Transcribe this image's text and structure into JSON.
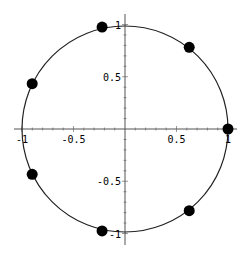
{
  "chart_data": {
    "type": "scatter",
    "title": "",
    "xlabel": "",
    "ylabel": "",
    "xlim": [
      -1.1,
      1.1
    ],
    "ylim": [
      -1.1,
      1.1
    ],
    "grid": false,
    "legend": null,
    "curve": {
      "name": "unit circle",
      "type": "circle",
      "center": [
        0,
        0
      ],
      "radius": 1
    },
    "series": [
      {
        "name": "7th roots of unity",
        "points": [
          {
            "x": 1.0,
            "y": 0.0
          },
          {
            "x": 0.6235,
            "y": 0.7818
          },
          {
            "x": -0.2225,
            "y": 0.9749
          },
          {
            "x": -0.901,
            "y": 0.4339
          },
          {
            "x": -0.901,
            "y": -0.4339
          },
          {
            "x": -0.2225,
            "y": -0.9749
          },
          {
            "x": 0.6235,
            "y": -0.7818
          }
        ]
      }
    ],
    "x_ticks": [
      {
        "value": -1,
        "label": "-1"
      },
      {
        "value": -0.5,
        "label": "-0.5"
      },
      {
        "value": 0.5,
        "label": "0.5"
      },
      {
        "value": 1,
        "label": "1"
      }
    ],
    "y_ticks": [
      {
        "value": 1,
        "label": "1"
      },
      {
        "value": 0.5,
        "label": "0.5"
      },
      {
        "value": -0.5,
        "label": "-0.5"
      },
      {
        "value": -1,
        "label": "-1"
      }
    ]
  },
  "style": {
    "axis_color": "#555555",
    "curve_color": "#222222",
    "point_color": "#000000"
  }
}
